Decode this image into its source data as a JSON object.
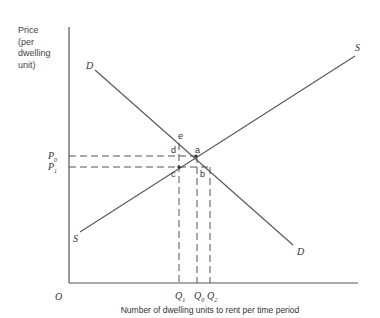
{
  "diagram": {
    "type": "supply-demand",
    "y_axis_label": "Price\n(per\ndwelling\nunit)",
    "x_axis_label": "Number of dwelling units to rent per time period",
    "origin_label": "O",
    "price_levels": [
      {
        "label": "P",
        "sub": "0"
      },
      {
        "label": "P",
        "sub": "1"
      }
    ],
    "quantity_levels": [
      {
        "label": "Q",
        "sub": "1"
      },
      {
        "label": "Q",
        "sub": "0"
      },
      {
        "label": "Q",
        "sub": "2"
      }
    ],
    "curves": {
      "demand_label_top": "D",
      "demand_label_bottom": "D",
      "supply_label_top": "S",
      "supply_label_bottom": "S"
    },
    "points": {
      "a": "a",
      "b": "b",
      "c": "c",
      "d": "d",
      "e": "e"
    },
    "colors": {
      "line": "#555555",
      "text": "#333333"
    }
  }
}
